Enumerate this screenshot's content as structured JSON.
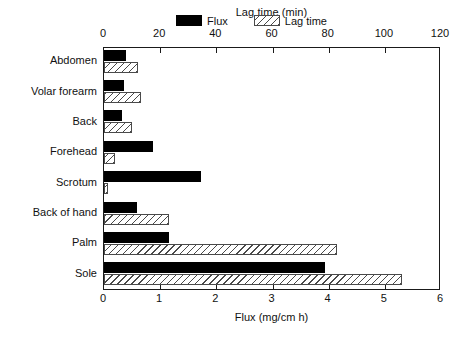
{
  "chart_data": {
    "type": "bar",
    "orientation": "horizontal",
    "title": "",
    "categories": [
      "Abdomen",
      "Volar forearm",
      "Back",
      "Forehead",
      "Scrotum",
      "Back of hand",
      "Palm",
      "Sole"
    ],
    "series": [
      {
        "name": "Flux",
        "axis": "bottom",
        "unit": "mg/cm h",
        "values": [
          0.4,
          0.35,
          0.32,
          0.87,
          1.72,
          0.58,
          1.16,
          3.93
        ]
      },
      {
        "name": "Lag time",
        "axis": "top",
        "unit": "min",
        "values": [
          12,
          13,
          10,
          4,
          1.5,
          23,
          83,
          106
        ]
      }
    ],
    "xlabel": "Flux (mg/cm h)",
    "xlabel_top": "Lag time (min)",
    "ylabel": "",
    "xlim": [
      0,
      6
    ],
    "xlim_top": [
      0,
      120
    ],
    "xticks": [
      0,
      1,
      2,
      3,
      4,
      5,
      6
    ],
    "xticks_top": [
      0,
      20,
      40,
      60,
      80,
      100,
      120
    ],
    "xticklabels": [
      "0",
      "1",
      "2",
      "3",
      "4",
      "5",
      "6"
    ],
    "xticklabels_top": [
      "0",
      "20",
      "40",
      "60",
      "80",
      "100",
      "120"
    ],
    "grid": false,
    "legend_position": "top-center-inside",
    "legend": [
      {
        "label": "Flux",
        "style": "solid-black",
        "color": "#000000"
      },
      {
        "label": "Lag time",
        "style": "hatched-diagonal",
        "color": "#4a4a4a"
      }
    ]
  }
}
